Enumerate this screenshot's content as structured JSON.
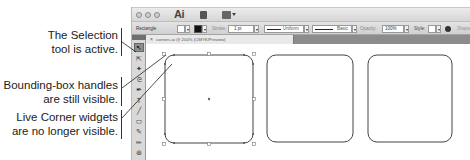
{
  "callouts": [
    {
      "line1": "The Selection",
      "line2": "tool is active."
    },
    {
      "line1": "Bounding-box handles",
      "line2": "are still visible."
    },
    {
      "line1": "Live Corner widgets",
      "line2": "are no longer visible."
    }
  ],
  "app": {
    "logo": "Ai",
    "control_bar": {
      "tool_name": "Rectangle",
      "stroke_label": "Stroke:",
      "stroke_value": "1 pt",
      "profile_label": "Uniform",
      "brush_label": "Basic",
      "opacity_label": "Opacity:",
      "opacity_value": "100%",
      "style_label": "Style:",
      "shape_label": "Shape"
    },
    "document_tab": {
      "title": "corners.ai @ 200% (CMYK/Preview)",
      "close_icon": "×"
    },
    "tools": [
      {
        "name": "selection-tool",
        "glyph": "↖",
        "active": true
      },
      {
        "name": "direct-selection-tool",
        "glyph": "⇱",
        "active": false
      },
      {
        "name": "magic-wand-tool",
        "glyph": "✦",
        "active": false
      },
      {
        "name": "lasso-tool",
        "glyph": "ᘓ",
        "active": false
      },
      {
        "name": "pen-tool",
        "glyph": "✒",
        "active": false
      },
      {
        "name": "type-tool",
        "glyph": "T",
        "active": false
      },
      {
        "name": "line-tool",
        "glyph": "╱",
        "active": false
      },
      {
        "name": "ellipse-tool",
        "glyph": "⬭",
        "active": false
      },
      {
        "name": "paintbrush-tool",
        "glyph": "✎",
        "active": false
      },
      {
        "name": "pencil-tool",
        "glyph": "✏",
        "active": false
      },
      {
        "name": "blob-brush-tool",
        "glyph": "⊛",
        "active": false
      }
    ]
  },
  "artwork": {
    "shapes": [
      {
        "name": "rounded-rectangle-selected",
        "selected": true
      },
      {
        "name": "rounded-rectangle-2",
        "selected": false
      },
      {
        "name": "rounded-rectangle-3",
        "selected": false
      }
    ]
  }
}
